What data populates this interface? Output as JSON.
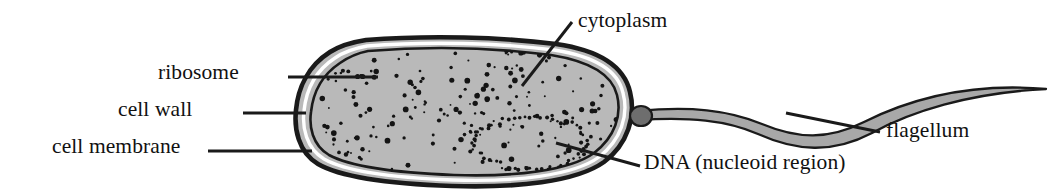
{
  "figure": {
    "background_color": "#ffffff",
    "ink_color": "#1a1a1a",
    "cytoplasm_fill": "#b9b9b9",
    "flagellum_fill": "#a8a8a8",
    "basal_body_fill": "#6e6e6e"
  },
  "labels": {
    "ribosome": "ribosome",
    "cell_wall": "cell wall",
    "cell_membrane": "cell membrane",
    "cytoplasm": "cytoplasm",
    "dna": "DNA (nucleoid region)",
    "flagellum": "flagellum"
  },
  "label_positions": {
    "ribosome": {
      "left": 158,
      "top": 62,
      "align": "right",
      "width": 130
    },
    "cell_wall": {
      "left": 118,
      "top": 99,
      "align": "right",
      "width": 170
    },
    "cell_membrane": {
      "left": 52,
      "top": 136,
      "align": "right",
      "width": 236
    },
    "cytoplasm": {
      "left": 578,
      "top": 10,
      "align": "left",
      "width": 150
    },
    "dna": {
      "left": 644,
      "top": 152,
      "align": "left",
      "width": 270
    },
    "flagellum": {
      "left": 886,
      "top": 120,
      "align": "left",
      "width": 128
    }
  },
  "leader_lines": {
    "ribosome": {
      "x1": 288,
      "y1": 77,
      "x2": 378,
      "y2": 77
    },
    "cell_wall": {
      "x1": 243,
      "y1": 113,
      "x2": 306,
      "y2": 113
    },
    "cell_membrane": {
      "x1": 208,
      "y1": 151,
      "x2": 312,
      "y2": 151
    },
    "cytoplasm": {
      "x1": 572,
      "y1": 22,
      "x2": 522,
      "y2": 86
    },
    "dna": {
      "x1": 640,
      "y1": 166,
      "x2": 556,
      "y2": 143
    },
    "flagellum": {
      "x1": 880,
      "y1": 132,
      "x2": 786,
      "y2": 113
    }
  },
  "cell_body": {
    "shape": "rounded irregular capsule",
    "bounds": {
      "x": 296,
      "y": 38,
      "width": 338,
      "height": 148
    },
    "wall_stroke_width": 4.5,
    "membrane_stroke_width": 2.6,
    "wall_gap": 5
  },
  "nucleoid": {
    "shape": "dotted closed loop",
    "center_x": 530,
    "center_y": 143,
    "radius_x": 58,
    "radius_y": 26,
    "dot_count": 64,
    "dot_radius": 1.5
  },
  "ribosomes": {
    "description": "stippled dots scattered through the cytoplasm",
    "count": 190,
    "min_radius": 0.9,
    "max_radius": 2.9
  },
  "flagellum": {
    "shape": "tapering S-curve ribbon",
    "start_x": 636,
    "start_y": 115,
    "end_x": 1048,
    "end_y": 91,
    "max_thickness": 9,
    "tip_thickness": 1
  },
  "basal_body": {
    "center_x": 641,
    "center_y": 116,
    "radius_x": 11,
    "radius_y": 10
  }
}
